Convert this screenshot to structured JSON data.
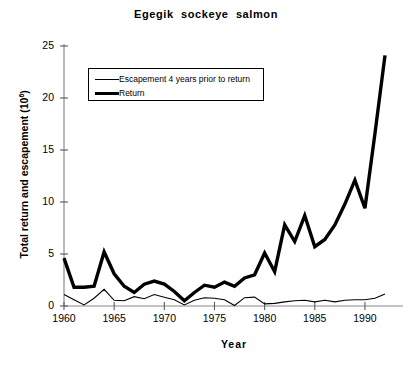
{
  "chart_data": {
    "type": "line",
    "title": "Egegik  sockeye  salmon",
    "xlabel": "Year",
    "ylabel": "Total return and escapement (10",
    "ylabel_sup": "6",
    "ylabel_suffix": ")",
    "xlim": [
      1960,
      1992
    ],
    "ylim": [
      0,
      25
    ],
    "yticks": [
      0,
      5,
      10,
      15,
      20,
      25
    ],
    "xticks": [
      1960,
      1965,
      1970,
      1975,
      1980,
      1985,
      1990
    ],
    "grid": false,
    "legend_position": "upper-left",
    "x": [
      1960,
      1961,
      1962,
      1963,
      1964,
      1965,
      1966,
      1967,
      1968,
      1969,
      1970,
      1971,
      1972,
      1973,
      1974,
      1975,
      1976,
      1977,
      1978,
      1979,
      1980,
      1981,
      1982,
      1983,
      1984,
      1985,
      1986,
      1987,
      1988,
      1989,
      1990,
      1991,
      1992
    ],
    "series": [
      {
        "name": "Escapement 4 years prior to return",
        "style": "thin",
        "values": [
          1.1,
          0.6,
          0.1,
          0.75,
          1.6,
          0.55,
          0.5,
          0.9,
          0.7,
          1.1,
          0.85,
          0.6,
          0.1,
          0.55,
          0.8,
          0.75,
          0.6,
          0.05,
          0.8,
          0.85,
          0.2,
          0.25,
          0.4,
          0.5,
          0.55,
          0.4,
          0.55,
          0.4,
          0.55,
          0.6,
          0.6,
          0.75,
          1.15
        ]
      },
      {
        "name": "Return",
        "style": "thick",
        "values": [
          4.6,
          1.8,
          1.8,
          1.9,
          5.2,
          3.1,
          1.9,
          1.3,
          2.1,
          2.4,
          2.1,
          1.4,
          0.5,
          1.3,
          2.0,
          1.8,
          2.3,
          1.9,
          2.7,
          3.0,
          5.1,
          3.3,
          7.8,
          6.2,
          8.7,
          5.7,
          6.4,
          7.8,
          9.8,
          12.1,
          9.4,
          16.6,
          24.1
        ]
      }
    ]
  },
  "legend": {
    "entries": [
      {
        "label": "Escapement 4 years prior to return"
      },
      {
        "label": "Return"
      }
    ]
  }
}
